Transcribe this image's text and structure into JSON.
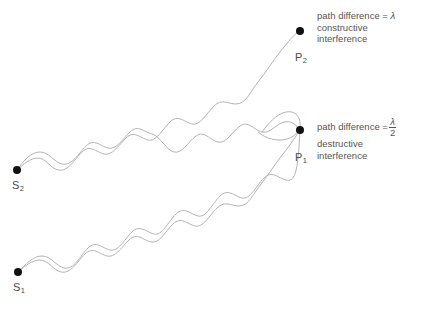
{
  "diagram": {
    "background_color": "#ffffff",
    "wave_color": "#b4b4b4",
    "node_color": "#111111",
    "text_color": "#555555"
  },
  "sources": [
    {
      "id": "S2",
      "label": "S",
      "subscript": "2",
      "x": 17,
      "y": 170
    },
    {
      "id": "S1",
      "label": "S",
      "subscript": "1",
      "x": 18,
      "y": 272
    }
  ],
  "points": [
    {
      "id": "P2",
      "label": "P",
      "subscript": "2",
      "x": 300,
      "y": 31
    },
    {
      "id": "P1",
      "label": "P",
      "subscript": "1",
      "x": 300,
      "y": 130
    }
  ],
  "annotations": [
    {
      "id": "constructive",
      "prefix": "path difference =",
      "value_type": "lambda",
      "lambda_symbol": "λ",
      "numerator": "",
      "denominator": "",
      "line2": "constructive",
      "line3": "interference"
    },
    {
      "id": "destructive",
      "prefix": "path difference =",
      "value_type": "fraction",
      "lambda_symbol": "λ",
      "numerator": "λ",
      "denominator": "2",
      "line2": "destructive",
      "line3": "interference"
    }
  ],
  "waves": {
    "stroke_width": 1,
    "paths": [
      {
        "id": "s2-to-p2",
        "from": "S2",
        "to": "P2",
        "d": "M 17 170 C 24 164 30 158 38 158 C 46 158 50 168 58 170 C 68 172 74 160 82 152 C 90 144 96 152 104 154 C 112 156 118 146 126 138 C 134 130 140 138 148 140 C 156 142 162 130 170 122 C 178 114 184 122 192 124 C 200 126 206 114 214 106 C 222 98 228 104 236 104 C 246 104 250 92 258 82 C 266 72 272 62 280 52 C 288 42 294 34 300 31"
      },
      {
        "id": "s2-to-p1",
        "from": "S2",
        "to": "P1",
        "d": "M 17 170 C 24 160 31 152 40 152 C 49 152 54 162 62 164 C 72 166 78 154 86 146 C 94 138 100 146 108 148 C 116 150 122 140 130 132 C 138 124 144 132 152 134 C 160 136 166 150 174 152 C 182 154 188 142 196 136 C 204 130 210 140 218 142 C 226 144 232 132 240 126 C 248 120 254 130 262 132 C 270 134 276 124 284 122 C 292 120 297 126 300 130"
      },
      {
        "id": "s1-to-p1",
        "from": "S1",
        "to": "P1",
        "d": "M 18 272 C 25 266 32 260 40 260 C 48 260 53 270 61 272 C 71 274 77 262 85 254 C 93 246 99 254 107 256 C 115 258 121 248 129 240 C 137 232 143 240 151 242 C 159 244 165 232 173 224 C 181 216 187 224 195 226 C 203 228 209 216 217 208 C 225 200 231 206 239 206 C 249 206 253 194 261 184 C 269 174 275 164 283 154 C 291 144 296 136 300 130"
      },
      {
        "id": "s1-to-p2",
        "from": "S1",
        "to": "P2",
        "d": "M 18 272 C 26 264 33 256 42 256 C 51 256 56 266 64 268 C 74 270 80 256 88 248 C 96 240 102 248 110 250 C 118 252 124 240 132 232 C 140 224 146 232 154 234 C 162 236 168 222 176 214 C 184 206 190 214 198 216 C 206 218 212 204 220 196 C 228 188 234 196 242 198 C 250 200 256 186 264 178 C 272 170 278 178 286 180 C 294 182 298 176 300 130"
      },
      {
        "id": "p1-loop",
        "from": "P1",
        "to": "P1",
        "d": "M 262 132 C 268 124 276 114 286 112 C 296 110 301 118 300 126 C 299 134 290 140 280 140 C 270 140 263 136 258 132"
      }
    ]
  }
}
